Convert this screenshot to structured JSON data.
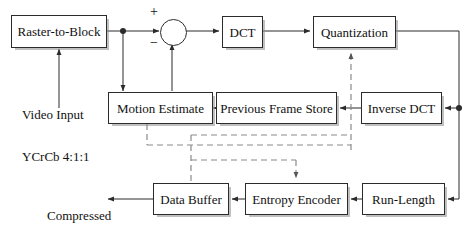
{
  "diagram": {
    "blocks": [
      {
        "id": "raster",
        "label": "Raster-to-Block",
        "x": 11,
        "y": 15,
        "w": 96,
        "h": 33
      },
      {
        "id": "dct",
        "label": "DCT",
        "x": 222,
        "y": 16,
        "w": 41,
        "h": 32
      },
      {
        "id": "quant",
        "label": "Quantization",
        "x": 313,
        "y": 16,
        "w": 83,
        "h": 32
      },
      {
        "id": "motion",
        "label": "Motion Estimate",
        "x": 108,
        "y": 92,
        "w": 105,
        "h": 32
      },
      {
        "id": "prevframe",
        "label": "Previous Frame Store",
        "x": 216,
        "y": 92,
        "w": 121,
        "h": 32
      },
      {
        "id": "idct",
        "label": "Inverse DCT",
        "x": 361,
        "y": 92,
        "w": 81,
        "h": 32
      },
      {
        "id": "buffer",
        "label": "Data Buffer",
        "x": 153,
        "y": 183,
        "w": 76,
        "h": 32
      },
      {
        "id": "entropy",
        "label": "Entropy Encoder",
        "x": 245,
        "y": 183,
        "w": 103,
        "h": 32
      },
      {
        "id": "runlength",
        "label": "Run-Length",
        "x": 362,
        "y": 183,
        "w": 83,
        "h": 32
      }
    ],
    "labels": [
      {
        "id": "video-input",
        "line1": "Video Input",
        "line2": "YCrCb 4:1:1",
        "x": 22,
        "y": 80,
        "align": "left"
      },
      {
        "id": "compressed",
        "line1": "Compressed",
        "line2": "Video Signal",
        "x": 47,
        "y": 181,
        "align": "left"
      }
    ],
    "summing_junction": {
      "id": "adder",
      "cx": 172,
      "cy": 31,
      "r": 12,
      "plus_sign": "+",
      "minus_sign": "−",
      "plus_x": 150,
      "plus_y": 7,
      "minus_x": 150,
      "minus_y": 38
    },
    "colors": {
      "stroke": "#2b2b2b",
      "dashed": "#8a8a8a",
      "text": "#111111",
      "background": "#ffffff",
      "shadow": "rgba(140,140,140,0.55)"
    },
    "legend": {
      "solid_meaning": "data path",
      "dashed_meaning": "control / feedback path"
    }
  }
}
